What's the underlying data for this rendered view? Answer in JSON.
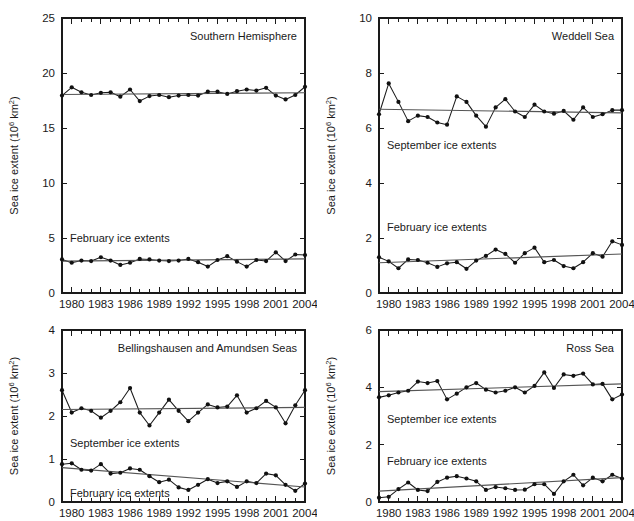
{
  "figure": {
    "axis_label_main": "Sea ice extent (10",
    "axis_label_sup": "6",
    "axis_label_tail": " km",
    "axis_label_sup2": "2",
    "axis_label_close": ")",
    "september_label": "September ice extents",
    "february_label": "February ice extents"
  },
  "chart_data": [
    {
      "type": "line",
      "title": "Southern Hemisphere",
      "xlabel": "",
      "ylabel": "Sea ice extent (10^6 km^2)",
      "xlim": [
        1979,
        2004
      ],
      "ylim": [
        0,
        25
      ],
      "yticks": [
        0,
        5,
        10,
        15,
        20,
        25
      ],
      "ytick_labels": [
        "0",
        "5",
        "10",
        "15",
        "20",
        "25"
      ],
      "xticks": [
        1980,
        1983,
        1986,
        1989,
        1992,
        1995,
        1998,
        2001,
        2004
      ],
      "xtick_labels": [
        "1980",
        "1983",
        "1986",
        "1989",
        "1992",
        "1995",
        "1998",
        "2001",
        "2004"
      ],
      "grid": false,
      "legend": "none",
      "x": [
        1979,
        1980,
        1981,
        1982,
        1983,
        1984,
        1985,
        1986,
        1987,
        1988,
        1989,
        1990,
        1991,
        1992,
        1993,
        1994,
        1995,
        1996,
        1997,
        1998,
        1999,
        2000,
        2001,
        2002,
        2003,
        2004
      ],
      "series": [
        {
          "name": "September ice extents",
          "values": [
            17.95,
            18.7,
            18.25,
            18.0,
            18.2,
            18.25,
            17.85,
            18.5,
            17.45,
            17.9,
            18.0,
            17.8,
            17.95,
            18.0,
            17.95,
            18.3,
            18.3,
            18.1,
            18.35,
            18.5,
            18.4,
            18.65,
            17.95,
            17.6,
            18.0,
            18.75
          ],
          "trend_start": 18.05,
          "trend_end": 18.2
        },
        {
          "name": "February ice extents",
          "values": [
            3.05,
            2.75,
            2.95,
            2.9,
            3.25,
            2.95,
            2.55,
            2.75,
            3.1,
            3.05,
            2.95,
            2.9,
            2.95,
            3.1,
            2.8,
            2.4,
            3.0,
            3.35,
            2.85,
            2.4,
            3.0,
            2.9,
            3.7,
            2.9,
            3.5,
            3.45
          ],
          "trend_start": 2.9,
          "trend_end": 3.1
        }
      ]
    },
    {
      "type": "line",
      "title": "Weddell Sea",
      "xlabel": "",
      "ylabel": "Sea ice extent (10^6 km^2)",
      "xlim": [
        1979,
        2004
      ],
      "ylim": [
        0,
        10
      ],
      "yticks": [
        0,
        2,
        4,
        6,
        8,
        10
      ],
      "ytick_labels": [
        "0",
        "2",
        "4",
        "6",
        "8",
        "10"
      ],
      "xticks": [
        1980,
        1983,
        1986,
        1989,
        1992,
        1995,
        1998,
        2001,
        2004
      ],
      "xtick_labels": [
        "1980",
        "1983",
        "1986",
        "1989",
        "1992",
        "1995",
        "1998",
        "2001",
        "2004"
      ],
      "grid": false,
      "legend": "none",
      "x": [
        1979,
        1980,
        1981,
        1982,
        1983,
        1984,
        1985,
        1986,
        1987,
        1988,
        1989,
        1990,
        1991,
        1992,
        1993,
        1994,
        1995,
        1996,
        1997,
        1998,
        1999,
        2000,
        2001,
        2002,
        2003,
        2004
      ],
      "series": [
        {
          "name": "September ice extents",
          "values": [
            6.5,
            7.62,
            6.95,
            6.25,
            6.45,
            6.4,
            6.2,
            6.12,
            7.15,
            6.95,
            6.45,
            6.05,
            6.75,
            7.05,
            6.6,
            6.4,
            6.85,
            6.6,
            6.52,
            6.62,
            6.3,
            6.75,
            6.4,
            6.5,
            6.65,
            6.65
          ],
          "trend_start": 6.68,
          "trend_end": 6.55
        },
        {
          "name": "February ice extents",
          "values": [
            1.3,
            1.15,
            0.9,
            1.22,
            1.2,
            1.1,
            0.95,
            1.08,
            1.12,
            0.88,
            1.18,
            1.35,
            1.58,
            1.42,
            1.1,
            1.45,
            1.65,
            1.12,
            1.2,
            0.98,
            0.9,
            1.12,
            1.45,
            1.32,
            1.88,
            1.75
          ],
          "trend_start": 1.1,
          "trend_end": 1.42
        }
      ]
    },
    {
      "type": "line",
      "title": "Bellingshausen and Amundsen Seas",
      "xlabel": "",
      "ylabel": "Sea ice extent (10^6 km^2)",
      "xlim": [
        1979,
        2004
      ],
      "ylim": [
        0,
        4
      ],
      "yticks": [
        0,
        1,
        2,
        3,
        4
      ],
      "ytick_labels": [
        "0",
        "1",
        "2",
        "3",
        "4"
      ],
      "xticks": [
        1980,
        1983,
        1986,
        1989,
        1992,
        1995,
        1998,
        2001,
        2004
      ],
      "xtick_labels": [
        "1980",
        "1983",
        "1986",
        "1989",
        "1992",
        "1995",
        "1998",
        "2001",
        "2004"
      ],
      "grid": false,
      "legend": "none",
      "x": [
        1979,
        1980,
        1981,
        1982,
        1983,
        1984,
        1985,
        1986,
        1987,
        1988,
        1989,
        1990,
        1991,
        1992,
        1993,
        1994,
        1995,
        1996,
        1997,
        1998,
        1999,
        2000,
        2001,
        2002,
        2003,
        2004
      ],
      "series": [
        {
          "name": "September ice extents",
          "values": [
            2.6,
            2.08,
            2.18,
            2.12,
            1.96,
            2.12,
            2.32,
            2.65,
            2.08,
            1.78,
            2.08,
            2.38,
            2.12,
            1.88,
            2.08,
            2.27,
            2.2,
            2.22,
            2.48,
            2.08,
            2.18,
            2.35,
            2.2,
            1.83,
            2.25,
            2.6
          ],
          "trend_start": 2.15,
          "trend_end": 2.2
        },
        {
          "name": "February ice extents",
          "values": [
            0.88,
            0.9,
            0.75,
            0.73,
            0.88,
            0.66,
            0.68,
            0.78,
            0.75,
            0.6,
            0.46,
            0.52,
            0.34,
            0.28,
            0.4,
            0.53,
            0.44,
            0.48,
            0.35,
            0.48,
            0.44,
            0.66,
            0.62,
            0.4,
            0.26,
            0.43
          ],
          "trend_start": 0.8,
          "trend_end": 0.35
        }
      ]
    },
    {
      "type": "line",
      "title": "Ross Sea",
      "xlabel": "",
      "ylabel": "Sea ice extent (10^6 km^2)",
      "xlim": [
        1979,
        2004
      ],
      "ylim": [
        0,
        6
      ],
      "yticks": [
        0,
        2,
        4,
        6
      ],
      "ytick_labels": [
        "0",
        "2",
        "4",
        "6"
      ],
      "xticks": [
        1980,
        1983,
        1986,
        1989,
        1992,
        1995,
        1998,
        2001,
        2004
      ],
      "xtick_labels": [
        "1980",
        "1983",
        "1986",
        "1989",
        "1992",
        "1995",
        "1998",
        "2001",
        "2004"
      ],
      "grid": false,
      "legend": "none",
      "x": [
        1979,
        1980,
        1981,
        1982,
        1983,
        1984,
        1985,
        1986,
        1987,
        1988,
        1989,
        1990,
        1991,
        1992,
        1993,
        1994,
        1995,
        1996,
        1997,
        1998,
        1999,
        2000,
        2001,
        2002,
        2003,
        2004
      ],
      "series": [
        {
          "name": "September ice extents",
          "values": [
            3.65,
            3.72,
            3.82,
            3.88,
            4.2,
            4.15,
            4.22,
            3.58,
            3.78,
            4.0,
            4.15,
            3.92,
            3.82,
            3.88,
            4.0,
            3.82,
            4.05,
            4.52,
            3.98,
            4.45,
            4.4,
            4.48,
            4.1,
            4.12,
            3.58,
            3.75
          ],
          "trend_start": 3.85,
          "trend_end": 4.12
        },
        {
          "name": "February ice extents",
          "values": [
            0.15,
            0.18,
            0.45,
            0.68,
            0.42,
            0.38,
            0.7,
            0.85,
            0.9,
            0.82,
            0.72,
            0.42,
            0.52,
            0.48,
            0.42,
            0.43,
            0.62,
            0.62,
            0.28,
            0.72,
            0.95,
            0.58,
            0.85,
            0.72,
            0.95,
            0.82
          ],
          "trend_start": 0.38,
          "trend_end": 0.85
        }
      ]
    }
  ]
}
